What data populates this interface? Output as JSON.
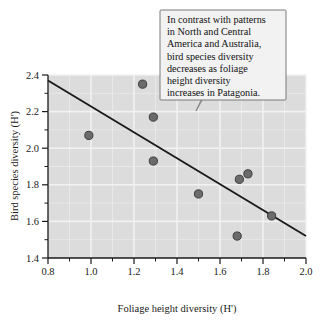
{
  "chart_data": {
    "type": "scatter",
    "title": "",
    "xlabel": "Foliage height diversity (H')",
    "ylabel": "Bird species diversity (H')",
    "xlim": [
      0.8,
      2.0
    ],
    "ylim": [
      1.4,
      2.4
    ],
    "xticks": [
      "0.8",
      "1.0",
      "1.2",
      "1.4",
      "1.6",
      "1.8",
      "2.0"
    ],
    "xtick_values": [
      0.8,
      1.0,
      1.2,
      1.4,
      1.6,
      1.8,
      2.0
    ],
    "xminor_values": [
      0.9,
      1.1,
      1.3,
      1.5,
      1.7,
      1.9
    ],
    "yticks": [
      "1.4",
      "1.6",
      "1.8",
      "2.0",
      "2.2",
      "2.4"
    ],
    "ytick_values": [
      1.4,
      1.6,
      1.8,
      2.0,
      2.2,
      2.4
    ],
    "yminor_values": [
      1.5,
      1.7,
      1.9,
      2.1,
      2.3
    ],
    "grid": true,
    "legend": "none",
    "points": [
      {
        "x": 0.99,
        "y": 2.07
      },
      {
        "x": 1.24,
        "y": 2.35
      },
      {
        "x": 1.29,
        "y": 2.17
      },
      {
        "x": 1.29,
        "y": 1.93
      },
      {
        "x": 1.5,
        "y": 1.75
      },
      {
        "x": 1.68,
        "y": 1.52
      },
      {
        "x": 1.69,
        "y": 1.83
      },
      {
        "x": 1.73,
        "y": 1.86
      },
      {
        "x": 1.84,
        "y": 1.63
      }
    ],
    "trendline": {
      "x0": 0.8,
      "y0": 2.37,
      "x1": 2.0,
      "y1": 1.52
    },
    "colors": {
      "plot_background": "#dcdcdc",
      "gridline": "#f2f2f2",
      "point_fill": "#6b6b6b",
      "point_stroke": "#3c3c3c",
      "trendline": "#1a1a1a",
      "axis": "#1a1a1a",
      "callout_background": "#f2f2f2",
      "callout_border": "#7a7a7a"
    }
  },
  "callout": {
    "lines": [
      "In contrast with patterns",
      "in North and Central",
      "America and Australia,",
      "bird species diversity",
      "decreases as foliage",
      "height diversity",
      "increases in Patagonia."
    ],
    "full_text": "In contrast with patterns in North and Central America and Australia, bird species diversity decreases as foliage height diversity increases in Patagonia."
  }
}
